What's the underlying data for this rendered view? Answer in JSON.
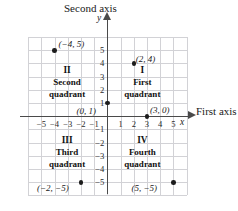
{
  "chart_data": {
    "type": "scatter",
    "title": "",
    "xlabel": "First axis",
    "ylabel": "Second axis",
    "x_letter": "y",
    "y_letter": "x",
    "xlim": [
      -6,
      6
    ],
    "ylim": [
      -6,
      6
    ],
    "grid": true,
    "legend": "none",
    "x_ticks": [
      "-5",
      "-4",
      "-3",
      "-2",
      "-1",
      "1",
      "2",
      "3",
      "4",
      "5"
    ],
    "x_tick_values": [
      -5,
      -4,
      -3,
      -2,
      -1,
      1,
      2,
      3,
      4,
      5
    ],
    "y_ticks": [
      "5",
      "4",
      "3",
      "2",
      "1",
      "-1",
      "-2",
      "-3",
      "-4",
      "-5"
    ],
    "y_tick_values": [
      5,
      4,
      3,
      2,
      1,
      -1,
      -2,
      -3,
      -4,
      -5
    ],
    "points": [
      {
        "label": "(-4, 5)",
        "x": -4,
        "y": 5
      },
      {
        "label": "(2, 4)",
        "x": 2,
        "y": 4
      },
      {
        "label": "(0, 1)",
        "x": 0,
        "y": 1
      },
      {
        "label": "(3, 0)",
        "x": 3,
        "y": 0
      },
      {
        "label": "(-2, -5)",
        "x": -2,
        "y": -5
      },
      {
        "label": "(5, -5)",
        "x": 5,
        "y": -5
      }
    ],
    "annotations": [
      {
        "roman": "I",
        "name": "First quadrant"
      },
      {
        "roman": "II",
        "name": "Second quadrant"
      },
      {
        "roman": "III",
        "name": "Third quadrant"
      },
      {
        "roman": "IV",
        "name": "Fourth quadrant"
      }
    ]
  },
  "axes": {
    "vertical_title": "Second axis",
    "horizontal_title": "First axis",
    "y_letter": "y",
    "x_letter": "x"
  },
  "quadrants": {
    "first": {
      "roman": "I",
      "line1": "First",
      "line2": "quadrant"
    },
    "second": {
      "roman": "II",
      "line1": "Second",
      "line2": "quadrant"
    },
    "third": {
      "roman": "III",
      "line1": "Third",
      "line2": "quadrant"
    },
    "fourth": {
      "roman": "IV",
      "line1": "Fourth",
      "line2": "quadrant"
    }
  },
  "point_labels": {
    "p_neg4_5": "(−4, 5)",
    "p_2_4": "(2, 4)",
    "p_0_1": "(0, 1)",
    "p_3_0": "(3, 0)",
    "p_neg2_neg5": "(−2, −5)",
    "p_5_neg5": "(5, −5)"
  },
  "x_tick_labels": {
    "m5": "−5",
    "m4": "−4",
    "m3": "−3",
    "m2": "−2",
    "m1": "−1",
    "p1": "1",
    "p2": "2",
    "p3": "3",
    "p4": "4",
    "p5": "5"
  },
  "y_tick_labels": {
    "p5": "5",
    "p4": "4",
    "p3": "3",
    "p2": "2",
    "p1": "1",
    "m1": "−1",
    "m2": "−2",
    "m3": "−3",
    "m4": "−4",
    "m5": "−5"
  },
  "colors": {
    "grid": "#d2d2d6",
    "axis": "#4a4a4a",
    "point": "#1c1c1c",
    "text": "#1a1a1a",
    "background": "#ffffff"
  }
}
